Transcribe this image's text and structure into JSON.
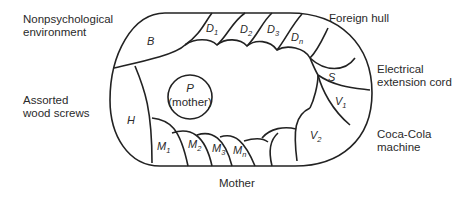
{
  "outer_labels": {
    "nonpsychological": [
      "Nonpsychological",
      "environment"
    ],
    "foreign_hull": "Foreign hull",
    "electrical": [
      "Electrical",
      "extension cord"
    ],
    "wood_screws": [
      "Assorted",
      "wood screws"
    ],
    "coca_cola": [
      "Coca-Cola",
      "machine"
    ],
    "mother": "Mother"
  },
  "center": {
    "symbol": "P",
    "caption": "(mother)"
  },
  "regions": {
    "B": {
      "main": "B",
      "sub": ""
    },
    "D1": {
      "main": "D",
      "sub": "1"
    },
    "D2": {
      "main": "D",
      "sub": "2"
    },
    "D3": {
      "main": "D",
      "sub": "3"
    },
    "Dn": {
      "main": "D",
      "sub": "n"
    },
    "S": {
      "main": "S",
      "sub": ""
    },
    "V1": {
      "main": "V",
      "sub": "1"
    },
    "V2": {
      "main": "V",
      "sub": "2"
    },
    "H": {
      "main": "H",
      "sub": ""
    },
    "M1": {
      "main": "M",
      "sub": "1"
    },
    "M2": {
      "main": "M",
      "sub": "2"
    },
    "M3": {
      "main": "M",
      "sub": "3"
    },
    "Mn": {
      "main": "M",
      "sub": "n"
    }
  }
}
